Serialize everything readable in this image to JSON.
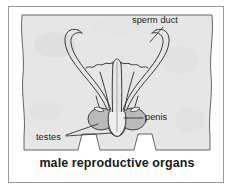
{
  "figure": {
    "caption": "male reproductive organs",
    "frame_color": "#9a9a9a",
    "background_color": "#ffffff",
    "body_fill_color": "#e6e6e6",
    "line_color": "#3a3a3a",
    "testis_fill_color": "#b8b8b8"
  },
  "labels": {
    "sperm_duct": "sperm duct",
    "penis": "penis",
    "testes": "testes"
  },
  "parts": {
    "body_silhouette": "torso-and-legs-outline",
    "left_duct_loop": "left-sperm-duct",
    "right_duct_loop": "right-sperm-duct",
    "urethra": "central-urethra-tube",
    "left_testis": "left-testis",
    "right_testis": "right-testis",
    "penis_shaft": "penis-shaft"
  }
}
